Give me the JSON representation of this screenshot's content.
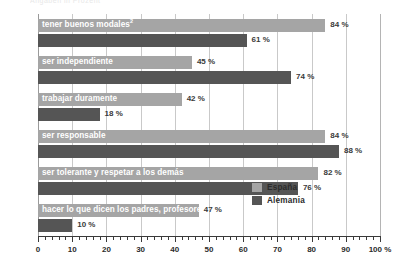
{
  "artifact": {
    "top_clipped_text": "Angaben in Prozent"
  },
  "chart_data": {
    "type": "bar",
    "orientation": "horizontal",
    "title": "",
    "subtitle": "",
    "xlabel": "",
    "ylabel": "",
    "xlim": [
      0,
      100
    ],
    "xticks": [
      0,
      10,
      20,
      30,
      40,
      50,
      60,
      70,
      80,
      90,
      100
    ],
    "xticklabels": [
      "0",
      "10",
      "20",
      "30",
      "40",
      "50",
      "60",
      "70",
      "80",
      "90",
      "100 %"
    ],
    "minor_tick_step": 2,
    "grid": "vertical",
    "legend_position": "inside-bottom-right",
    "value_suffix": "%",
    "categories": [
      "tener buenos modales",
      "ser independiente",
      "trabajar duramente",
      "ser responsable",
      "ser tolerante y respetar a los demás",
      "hacer lo que dicen los padres, profesores ..."
    ],
    "category_footnotes": [
      "2",
      "",
      "",
      "",
      "",
      ""
    ],
    "series": [
      {
        "name": "España",
        "color": "#a5a5a5",
        "values": [
          84,
          45,
          42,
          84,
          82,
          47
        ],
        "value_labels": [
          "84 %",
          "45 %",
          "42 %",
          "84 %",
          "82 %",
          "47 %"
        ]
      },
      {
        "name": "Alemania",
        "color": "#555555",
        "values": [
          61,
          74,
          18,
          88,
          76,
          10
        ],
        "value_labels": [
          "61 %",
          "74 %",
          "18 %",
          "88 %",
          "76 %",
          "10 %"
        ]
      }
    ]
  },
  "legend": {
    "items": [
      {
        "label": "España",
        "color": "#a5a5a5"
      },
      {
        "label": "Alemania",
        "color": "#555555"
      }
    ]
  }
}
